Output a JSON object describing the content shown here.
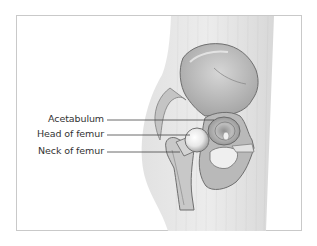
{
  "figure": {
    "labels": [
      {
        "text": "Acetabulum",
        "y": 120
      },
      {
        "text": "Head of femur",
        "y": 135
      },
      {
        "text": "Neck of femur",
        "y": 152
      }
    ]
  },
  "colors": {
    "frame_border": "#c9c9c9",
    "body": "#e6e6e6",
    "bone_light": "#d9d9d9",
    "bone_mid": "#b5b5b5",
    "bone_dark": "#7a7a7a",
    "leader_line": "#444444",
    "label_text": "#333333"
  }
}
